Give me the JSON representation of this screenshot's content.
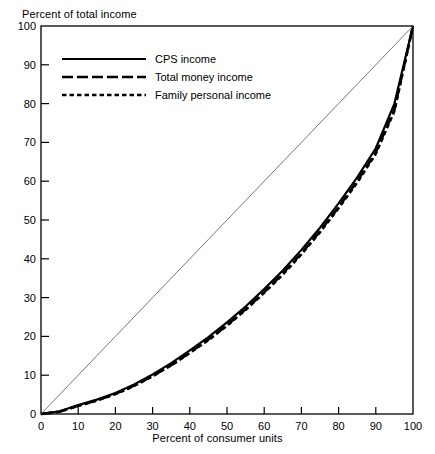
{
  "chart_data": {
    "type": "line",
    "title": "",
    "xlabel": "Percent of consumer units",
    "ylabel": "Percent of total income",
    "xlim": [
      0,
      100
    ],
    "ylim": [
      0,
      100
    ],
    "xticks": [
      "0",
      "10",
      "20",
      "30",
      "40",
      "50",
      "60",
      "70",
      "80",
      "90",
      "100"
    ],
    "yticks": [
      "0",
      "10",
      "20",
      "30",
      "40",
      "50",
      "60",
      "70",
      "80",
      "90",
      "100"
    ],
    "grid": false,
    "legend_position": "top-left",
    "x": [
      0,
      5,
      10,
      15,
      20,
      25,
      30,
      35,
      40,
      45,
      50,
      55,
      60,
      65,
      70,
      75,
      80,
      85,
      90,
      95,
      100
    ],
    "series": [
      {
        "name": "CPS income",
        "style": "solid",
        "values": [
          0,
          0.7,
          2.3,
          3.7,
          5.4,
          7.6,
          10.2,
          13.1,
          16.4,
          19.8,
          23.6,
          27.7,
          32.2,
          37.0,
          42.3,
          48.0,
          54.3,
          61.0,
          68.5,
          80.0,
          100
        ]
      },
      {
        "name": "Total money income",
        "style": "long-dash",
        "values": [
          0,
          0.6,
          2.1,
          3.5,
          5.2,
          7.3,
          9.8,
          12.6,
          15.8,
          19.2,
          22.9,
          27.0,
          31.4,
          36.2,
          41.4,
          47.1,
          53.3,
          60.0,
          67.4,
          78.5,
          100
        ]
      },
      {
        "name": "Family personal income",
        "style": "short-dash",
        "values": [
          0,
          0.6,
          2.1,
          3.4,
          5.1,
          7.2,
          9.7,
          12.5,
          15.7,
          19.0,
          22.7,
          26.8,
          31.2,
          35.9,
          41.1,
          46.8,
          53.0,
          59.6,
          67.0,
          78.0,
          100
        ]
      },
      {
        "name": "line of equality",
        "style": "thin-diagonal",
        "values": [
          0,
          5,
          10,
          15,
          20,
          25,
          30,
          35,
          40,
          45,
          50,
          55,
          60,
          65,
          70,
          75,
          80,
          85,
          90,
          95,
          100
        ]
      }
    ],
    "annotations": []
  },
  "axes": {
    "y_axis_caption": "Percent of total income",
    "x_axis_caption": "Percent of consumer units"
  },
  "legend": {
    "entries": [
      {
        "label": "CPS income",
        "style": "solid"
      },
      {
        "label": "Total money income",
        "style": "long-dash"
      },
      {
        "label": "Family personal income",
        "style": "short-dash"
      }
    ]
  },
  "colors": {
    "ink": "#000000",
    "paper": "#ffffff",
    "equality_line": "#555555"
  }
}
